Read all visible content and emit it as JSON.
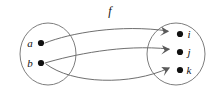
{
  "diagram": {
    "kind": "function-mapping-diagram",
    "function_label": "f",
    "stroke_color": "#7d7d7d",
    "dot_color": "#111111",
    "background_color": "#ffffff",
    "domain_set": {
      "name": "domain-set",
      "shape": "ellipse",
      "cx": 48,
      "cy": 54,
      "rx": 28,
      "ry": 31,
      "elements": [
        {
          "label": "a",
          "dot_x": 41,
          "dot_y": 43,
          "label_x": 30,
          "label_y": 47
        },
        {
          "label": "b",
          "dot_x": 41,
          "dot_y": 63,
          "label_x": 30,
          "label_y": 67
        }
      ]
    },
    "codomain_set": {
      "name": "codomain-set",
      "shape": "ellipse",
      "cx": 176,
      "cy": 54,
      "rx": 29,
      "ry": 31,
      "elements": [
        {
          "label": "i",
          "dot_x": 180,
          "dot_y": 34,
          "label_x": 189,
          "label_y": 38
        },
        {
          "label": "j",
          "dot_x": 180,
          "dot_y": 52,
          "label_x": 189,
          "label_y": 56
        },
        {
          "label": "k",
          "dot_x": 180,
          "dot_y": 70,
          "label_x": 189,
          "label_y": 74
        }
      ]
    },
    "mappings": [
      {
        "name": "arrow-a-to-i",
        "from": "a",
        "to": "i",
        "path": "M 45 43 C 70 33 120 24 168 31"
      },
      {
        "name": "arrow-b-to-j",
        "from": "b",
        "to": "j",
        "path": "M 45 63 C 72 55 122 44 169 49"
      },
      {
        "name": "arrow-b-to-k",
        "from": "b",
        "to": "k",
        "path": "M 46 64 C 72 84 130 86 169 68"
      }
    ],
    "function_label_pos": {
      "x": 110,
      "y": 15
    }
  }
}
